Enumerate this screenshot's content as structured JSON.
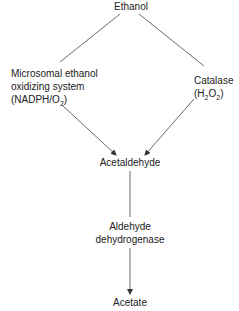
{
  "diagram": {
    "type": "metabolic-pathway",
    "nodes": {
      "ethanol": "Ethanol",
      "meos": {
        "line1": "Microsomal ethanol",
        "line2": "oxidizing system",
        "line3_pre": "(NADPH/O",
        "line3_sub": "2",
        "line3_post": ")"
      },
      "catalase": {
        "line1": "Catalase",
        "line2_pre": "(H",
        "line2_sub1": "2",
        "line2_mid": "O",
        "line2_sub2": "2",
        "line2_post": ")"
      },
      "acetaldehyde": "Acetaldehyde",
      "aldh": {
        "line1": "Aldehyde",
        "line2": "dehydrogenase"
      },
      "acetate": "Acetate"
    },
    "edges": [
      {
        "from": "Ethanol",
        "to": "Microsomal ethanol oxidizing system",
        "arrow": false
      },
      {
        "from": "Ethanol",
        "to": "Catalase",
        "arrow": false
      },
      {
        "from": "Microsomal ethanol oxidizing system",
        "to": "Acetaldehyde",
        "arrow": true
      },
      {
        "from": "Catalase",
        "to": "Acetaldehyde",
        "arrow": true
      },
      {
        "from": "Acetaldehyde",
        "to": "Aldehyde dehydrogenase",
        "arrow": false
      },
      {
        "from": "Aldehyde dehydrogenase",
        "to": "Acetate",
        "arrow": true
      }
    ],
    "colors": {
      "line": "#333333",
      "text": "#222222",
      "background": "#ffffff"
    }
  }
}
